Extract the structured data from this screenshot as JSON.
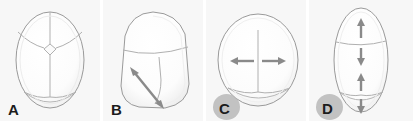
{
  "figure": {
    "background_color": "#ffffff",
    "panel_background_color": "#f7f7f7",
    "suture_line_color": "#b0b0b0",
    "skull_outline_color": "#9a9a9a",
    "arrow_color": "#8a8a8a",
    "label_color": "#1c1c1c",
    "label_blob_color": "#b9b9b9",
    "panel_count": 4
  },
  "panels": [
    {
      "label": "A",
      "has_label_blob": false,
      "skull_shape": "normal-oval-vertex-view",
      "sutures": [
        "metopic",
        "coronal-left",
        "coronal-right",
        "sagittal",
        "lambdoid-left",
        "lambdoid-right"
      ],
      "fontanelle": "anterior-fontanelle",
      "arrows": []
    },
    {
      "label": "B",
      "has_label_blob": false,
      "skull_shape": "asymmetric-trapezoid-plagiocephaly",
      "sutures": [
        "coronal-fused-right",
        "sagittal"
      ],
      "fontanelle": "none",
      "arrows": [
        {
          "orientation": "diagonal",
          "heads": "double",
          "direction": "upper-left-to-lower-right"
        }
      ]
    },
    {
      "label": "C",
      "has_label_blob": true,
      "skull_shape": "wide-round-brachycephaly",
      "sutures": [
        "sagittal",
        "lambdoid-left",
        "lambdoid-right"
      ],
      "fontanelle": "none",
      "arrows": [
        {
          "orientation": "horizontal",
          "heads": "single",
          "direction": "left"
        },
        {
          "orientation": "horizontal",
          "heads": "single",
          "direction": "right"
        }
      ]
    },
    {
      "label": "D",
      "has_label_blob": true,
      "skull_shape": "narrow-elongated-scaphocephaly",
      "sutures": [
        "coronal",
        "lambdoid-left",
        "lambdoid-right"
      ],
      "fontanelle": "none",
      "arrows": [
        {
          "orientation": "vertical",
          "heads": "single",
          "direction": "up",
          "position": "anterior-above-coronal"
        },
        {
          "orientation": "vertical",
          "heads": "single",
          "direction": "down",
          "position": "anterior-below-coronal"
        },
        {
          "orientation": "vertical",
          "heads": "single",
          "direction": "up",
          "position": "posterior-above-lambdoid"
        },
        {
          "orientation": "vertical",
          "heads": "single",
          "direction": "down",
          "position": "posterior-below-lambdoid"
        }
      ]
    }
  ]
}
